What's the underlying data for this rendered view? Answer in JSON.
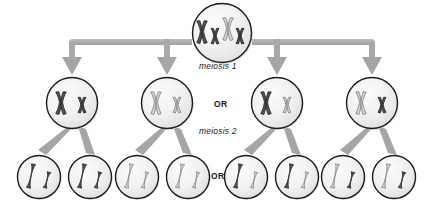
{
  "diagram": {
    "colors": {
      "background": "#ffffff",
      "cell_fill_light": "#f2f2f0",
      "cell_fill_dark": "#e4e4e2",
      "cell_stroke": "#1c1c1c",
      "arrow_grey": "#a9a9a9",
      "arrow_grey_dark": "#969696",
      "chromosome_dark": "#4c4c4c",
      "chromosome_dark_stroke": "#2b2b2b",
      "chromosome_light": "#c9c9c9",
      "chromosome_light_stroke": "#8a8a8a",
      "label_text": "#1a1a1a",
      "shadow": "#d8d8d6"
    },
    "labels": [
      {
        "name": "meiosis-1-label",
        "text": "meiosis 1",
        "style": "italic",
        "x": 199,
        "y": 66
      },
      {
        "name": "or-label-meiosis1",
        "text": "OR",
        "style": "bold",
        "x": 214,
        "y": 104
      },
      {
        "name": "meiosis-2-label",
        "text": "meiosis 2",
        "style": "italic",
        "x": 199,
        "y": 131
      },
      {
        "name": "or-label-meiosis2",
        "text": "OR",
        "style": "bold",
        "x": 211,
        "y": 176
      }
    ],
    "parent_cell": {
      "name": "parent-cell",
      "label": "Diploid parent cell with two homologous chromosome pairs",
      "cx": 222,
      "cy": 33,
      "r": 30,
      "chromosomes": [
        {
          "id": "large-dark",
          "shade": "dark",
          "size": "large"
        },
        {
          "id": "small-dark",
          "shade": "dark",
          "size": "small"
        },
        {
          "id": "small-light",
          "shade": "light",
          "size": "small"
        },
        {
          "id": "large-light",
          "shade": "light",
          "size": "large"
        }
      ]
    },
    "meiosis1_cells": [
      {
        "name": "meiosis1-cell-1",
        "cx": 72,
        "cy": 103,
        "r": 26,
        "chromosomes": [
          {
            "shade": "dark",
            "size": "large"
          },
          {
            "shade": "dark",
            "size": "small"
          }
        ]
      },
      {
        "name": "meiosis1-cell-2",
        "cx": 167,
        "cy": 103,
        "r": 26,
        "chromosomes": [
          {
            "shade": "light",
            "size": "large"
          },
          {
            "shade": "light",
            "size": "small"
          }
        ]
      },
      {
        "name": "meiosis1-cell-3",
        "cx": 277,
        "cy": 103,
        "r": 26,
        "chromosomes": [
          {
            "shade": "dark",
            "size": "large"
          },
          {
            "shade": "light",
            "size": "small"
          }
        ]
      },
      {
        "name": "meiosis1-cell-4",
        "cx": 372,
        "cy": 103,
        "r": 26,
        "chromosomes": [
          {
            "shade": "light",
            "size": "large"
          },
          {
            "shade": "dark",
            "size": "small"
          }
        ]
      }
    ],
    "meiosis2_cells": [
      {
        "name": "gamete-cell-1",
        "cx": 39,
        "cy": 177,
        "r": 22,
        "chromatids": [
          {
            "shade": "dark",
            "size": "large"
          },
          {
            "shade": "dark",
            "size": "small"
          }
        ]
      },
      {
        "name": "gamete-cell-2",
        "cx": 90,
        "cy": 177,
        "r": 22,
        "chromatids": [
          {
            "shade": "dark",
            "size": "large"
          },
          {
            "shade": "dark",
            "size": "small"
          }
        ]
      },
      {
        "name": "gamete-cell-3",
        "cx": 137,
        "cy": 177,
        "r": 22,
        "chromatids": [
          {
            "shade": "light",
            "size": "large"
          },
          {
            "shade": "light",
            "size": "small"
          }
        ]
      },
      {
        "name": "gamete-cell-4",
        "cx": 188,
        "cy": 177,
        "r": 22,
        "chromatids": [
          {
            "shade": "light",
            "size": "large"
          },
          {
            "shade": "light",
            "size": "small"
          }
        ]
      },
      {
        "name": "gamete-cell-5",
        "cx": 246,
        "cy": 177,
        "r": 22,
        "chromatids": [
          {
            "shade": "dark",
            "size": "large"
          },
          {
            "shade": "light",
            "size": "small"
          }
        ]
      },
      {
        "name": "gamete-cell-6",
        "cx": 297,
        "cy": 177,
        "r": 22,
        "chromatids": [
          {
            "shade": "dark",
            "size": "large"
          },
          {
            "shade": "light",
            "size": "small"
          }
        ]
      },
      {
        "name": "gamete-cell-7",
        "cx": 343,
        "cy": 177,
        "r": 22,
        "chromatids": [
          {
            "shade": "light",
            "size": "large"
          },
          {
            "shade": "dark",
            "size": "small"
          }
        ]
      },
      {
        "name": "gamete-cell-8",
        "cx": 394,
        "cy": 177,
        "r": 22,
        "chromatids": [
          {
            "shade": "light",
            "size": "large"
          },
          {
            "shade": "dark",
            "size": "small"
          }
        ]
      }
    ],
    "connectors": {
      "name": "meiosis1-bus",
      "bar_y": 42,
      "bar_left": 66,
      "bar_right": 378,
      "bar_thickness": 6,
      "arrow_targets_x": [
        72,
        167,
        277,
        372
      ],
      "arrow_tip_y": 74,
      "gap_left": 192,
      "gap_right": 252
    }
  }
}
